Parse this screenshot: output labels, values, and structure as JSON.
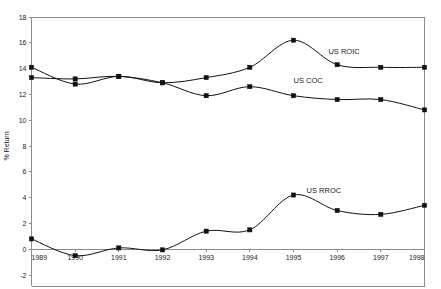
{
  "chart_data": {
    "type": "line",
    "title": "",
    "xlabel": "",
    "ylabel": "% Return",
    "ylim": [
      -2,
      18
    ],
    "ytick_step": 2,
    "grid": false,
    "legend_position": "inline-annotation",
    "categories": [
      "1989",
      "1990",
      "1991",
      "1992",
      "1993",
      "1994",
      "1995",
      "1996",
      "1997",
      "1998"
    ],
    "x": [
      1989,
      1990,
      1991,
      1992,
      1993,
      1994,
      1995,
      1996,
      1997,
      1998
    ],
    "yticks": [
      -2,
      0,
      2,
      4,
      6,
      8,
      10,
      12,
      14,
      16,
      18
    ],
    "ytick_labels": [
      "-2",
      "0",
      "2",
      "4",
      "6",
      "8",
      "10",
      "12",
      "14",
      "16",
      "18"
    ],
    "series": [
      {
        "name": "US ROIC",
        "label": "US ROIC",
        "color": "#111111",
        "marker": "square",
        "values": [
          14.1,
          12.8,
          13.4,
          12.9,
          13.3,
          14.1,
          16.2,
          14.3,
          14.1,
          14.1
        ]
      },
      {
        "name": "US COC",
        "label": "US COC",
        "color": "#111111",
        "marker": "square",
        "values": [
          13.3,
          13.2,
          13.4,
          12.9,
          11.9,
          12.6,
          11.9,
          11.6,
          11.6,
          10.8
        ]
      },
      {
        "name": "US RROC",
        "label": "US RROC",
        "color": "#111111",
        "marker": "square",
        "values": [
          0.8,
          -0.5,
          0.1,
          -0.05,
          1.4,
          1.5,
          4.2,
          3.0,
          2.7,
          3.4
        ]
      }
    ],
    "annotations": [
      {
        "text": "US ROIC",
        "x": 1995.8,
        "y": 15.1
      },
      {
        "text": "US COC",
        "x": 1995.0,
        "y": 12.9
      },
      {
        "text": "US RROC",
        "x": 1995.3,
        "y": 4.35
      }
    ]
  },
  "axis": {
    "y_title": "% Return"
  }
}
